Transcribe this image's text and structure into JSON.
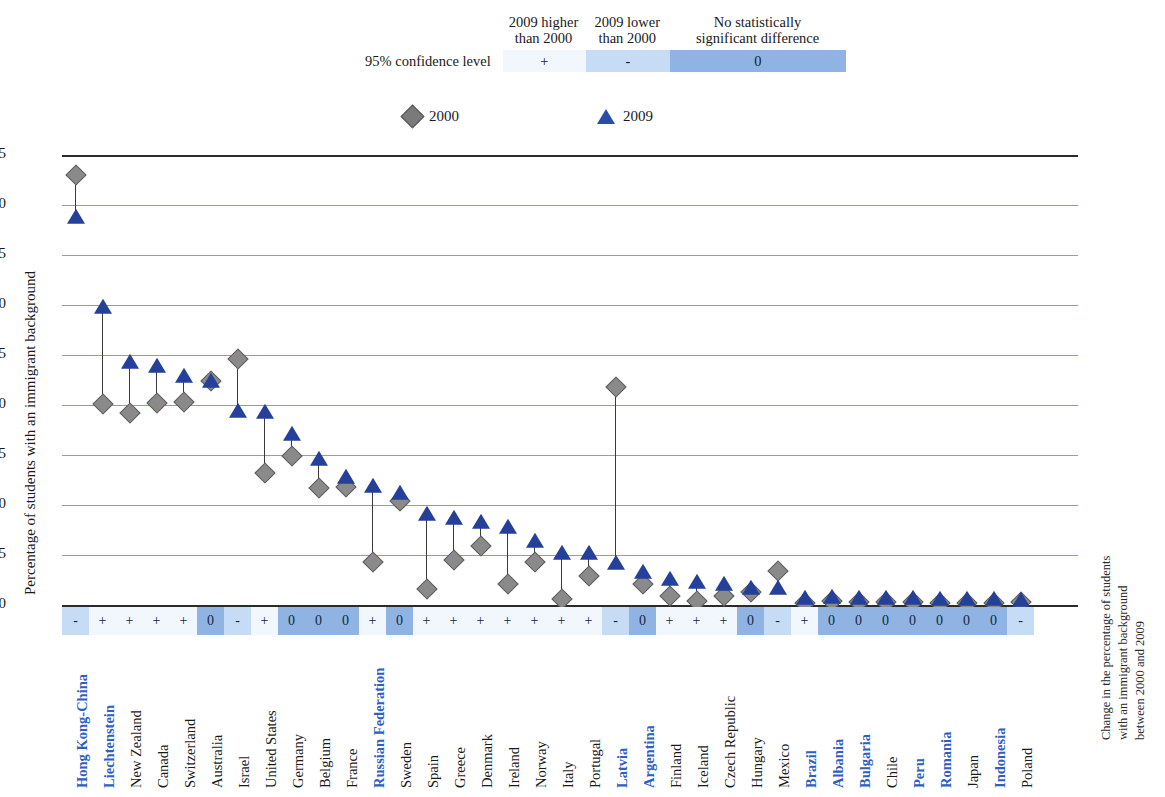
{
  "significance_legend": {
    "row_label": "95% confidence level",
    "headers": [
      {
        "line1": "2009 higher",
        "line2": "than 2000"
      },
      {
        "line1": "2009 lower",
        "line2": "than 2000"
      },
      {
        "line1": "No statistically",
        "line2": "significant difference"
      }
    ],
    "cells": [
      "+",
      "-",
      "0"
    ],
    "colors": {
      "plus": "#f2f7fd",
      "minus": "#c5dcf4",
      "zero": "#8fb4e3"
    }
  },
  "series_legend": [
    {
      "marker": "diamond-marker",
      "label": "2000",
      "color": "#7a7a7a"
    },
    {
      "marker": "triangle-marker",
      "label": "2009",
      "color": "#2a4da8"
    }
  ],
  "axes": {
    "ylabel": "Percentage of students with an immigrant background",
    "right_label_lines": [
      "Change in the percentage of students",
      "with an immigrant background",
      "between 2000 and 2009"
    ],
    "yticks": [
      "45",
      "40",
      "35",
      "30",
      "25",
      "20",
      "15",
      "10",
      "5",
      "0"
    ]
  },
  "chart_data": {
    "type": "scatter",
    "title": "",
    "xlabel": "",
    "ylabel": "Percentage of students with an immigrant background",
    "ylim": [
      0,
      45
    ],
    "ytick_values": [
      0,
      5,
      10,
      15,
      20,
      25,
      30,
      35,
      40,
      45
    ],
    "grid": true,
    "legend_position": "top",
    "series": [
      {
        "name": "2000",
        "marker": "diamond",
        "color": "#7a7a7a",
        "values": [
          43.0,
          20.1,
          19.2,
          20.2,
          20.3,
          22.4,
          24.6,
          13.2,
          14.9,
          11.7,
          11.8,
          4.3,
          10.4,
          1.6,
          4.5,
          5.9,
          2.1,
          4.3,
          0.6,
          2.9,
          21.8,
          2.1,
          0.9,
          0.4,
          0.9,
          1.3,
          3.4,
          0.2,
          0.4,
          0.3,
          0.3,
          0.3,
          0.2,
          0.2,
          0.2,
          0.3
        ]
      },
      {
        "name": "2009",
        "marker": "triangle",
        "color": "#24409a",
        "values": [
          38.7,
          29.7,
          24.2,
          23.8,
          22.8,
          22.3,
          19.3,
          19.2,
          17.0,
          14.5,
          12.7,
          11.8,
          11.1,
          9.0,
          8.6,
          8.2,
          7.7,
          6.3,
          5.1,
          5.1,
          4.1,
          3.2,
          2.5,
          2.2,
          2.0,
          1.6,
          1.6,
          0.6,
          0.7,
          0.6,
          0.6,
          0.6,
          0.5,
          0.5,
          0.5,
          0.4
        ]
      }
    ],
    "categories": [
      "Hong Kong-China",
      "Liechtenstein",
      "New Zealand",
      "Canada",
      "Switzerland",
      "Australia",
      "Israel",
      "United States",
      "Germany",
      "Belgium",
      "France",
      "Russian Federation",
      "Sweden",
      "Spain",
      "Greece",
      "Denmark",
      "Ireland",
      "Norway",
      "Italy",
      "Portugal",
      "Latvia",
      "Argentina",
      "Finland",
      "Iceland",
      "Czech Republic",
      "Hungary",
      "Mexico",
      "Brazil",
      "Albania",
      "Bulgaria",
      "Chile",
      "Peru",
      "Romania",
      "Japan",
      "Indonesia",
      "Poland"
    ],
    "significance": [
      "-",
      "+",
      "+",
      "+",
      "+",
      "0",
      "-",
      "+",
      "0",
      "0",
      "0",
      "+",
      "0",
      "+",
      "+",
      "+",
      "+",
      "+",
      "+",
      "+",
      "-",
      "0",
      "+",
      "+",
      "+",
      "0",
      "-",
      "+",
      "0",
      "0",
      "0",
      "0",
      "0",
      "0",
      "0",
      "-"
    ],
    "highlighted_categories": [
      "Hong Kong-China",
      "Liechtenstein",
      "Russian Federation",
      "Latvia",
      "Argentina",
      "Brazil",
      "Albania",
      "Bulgaria",
      "Peru",
      "Romania",
      "Indonesia"
    ]
  }
}
